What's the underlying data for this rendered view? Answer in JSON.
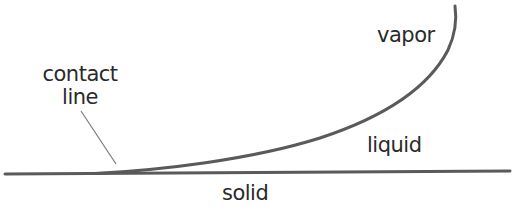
{
  "diagram": {
    "type": "contact-line-schematic",
    "labels": {
      "contact_line_1": "contact",
      "contact_line_2": "line",
      "vapor": "vapor",
      "liquid": "liquid",
      "solid": "solid"
    },
    "colors": {
      "line": "#5a5a5a",
      "pointer": "#7a7a7a",
      "text": "#2a2a2a",
      "background": "#ffffff"
    },
    "shapes": {
      "solid_surface": "horizontal line spanning width",
      "liquid_interface": "curve rising from contact line to top right",
      "pointer": "thin leader line from label to contact point"
    }
  }
}
